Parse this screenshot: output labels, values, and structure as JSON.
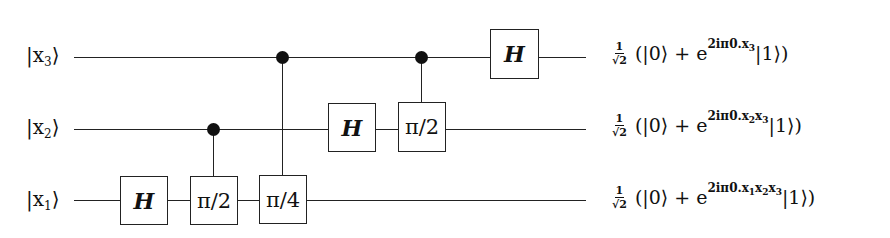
{
  "diagram": {
    "type": "quantum-circuit",
    "qubits": [
      {
        "id": "x3",
        "label_main": "|x",
        "label_sub": "3",
        "label_close": "⟩",
        "y": 57
      },
      {
        "id": "x2",
        "label_main": "|x",
        "label_sub": "2",
        "label_close": "⟩",
        "y": 129
      },
      {
        "id": "x1",
        "label_main": "|x",
        "label_sub": "1",
        "label_close": "⟩",
        "y": 201
      }
    ],
    "gates": [
      {
        "qubit": "x1",
        "label": "H",
        "control": null
      },
      {
        "qubit": "x1",
        "label": "π/2",
        "control": "x2"
      },
      {
        "qubit": "x1",
        "label": "π/4",
        "control": "x3"
      },
      {
        "qubit": "x2",
        "label": "H",
        "control": null
      },
      {
        "qubit": "x2",
        "label": "π/2",
        "control": "x3"
      },
      {
        "qubit": "x3",
        "label": "H",
        "control": null
      }
    ],
    "outputs": [
      {
        "qubit": "x3",
        "frac_num": "1",
        "frac_den": "√2",
        "open": "(|0⟩ + e",
        "exp_prefix": "2iπ0.x",
        "exp_parts": [
          {
            "sub": "3",
            "next": ""
          }
        ],
        "close": " |1⟩)"
      },
      {
        "qubit": "x2",
        "frac_num": "1",
        "frac_den": "√2",
        "open": "(|0⟩ + e",
        "exp_prefix": "2iπ0.x",
        "exp_parts": [
          {
            "sub": "2",
            "next": "x"
          },
          {
            "sub": "3",
            "next": ""
          }
        ],
        "close": " |1⟩)"
      },
      {
        "qubit": "x1",
        "frac_num": "1",
        "frac_den": "√2",
        "open": "(|0⟩ + e",
        "exp_prefix": "2iπ0.x",
        "exp_parts": [
          {
            "sub": "1",
            "next": "x"
          },
          {
            "sub": "2",
            "next": "x"
          },
          {
            "sub": "3",
            "next": ""
          }
        ],
        "close": " |1⟩)"
      }
    ],
    "colors": {
      "line": "#222222",
      "background": "#ffffff",
      "text": "#111111"
    }
  }
}
